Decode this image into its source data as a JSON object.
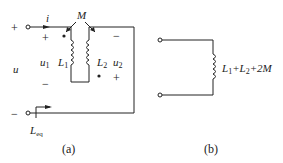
{
  "figure_a": {
    "caption": "(a)",
    "plus_terminal": "+",
    "minus_terminal": "−",
    "current_label": "i",
    "mutual_label": "M",
    "voltage_label": "u",
    "u1_label": "u",
    "u1_sub": "1",
    "u2_label": "u",
    "u2_sub": "2",
    "L1_label": "L",
    "L1_sub": "1",
    "L2_label": "L",
    "L2_sub": "2",
    "u1_plus": "+",
    "u1_minus": "−",
    "u2_plus": "+",
    "u2_minus": "−",
    "Leq_label": "L",
    "Leq_sub": "eq"
  },
  "figure_b": {
    "caption": "(b)",
    "inductance_label": "L",
    "inductance_sub1": "1",
    "plus1": "+L",
    "inductance_sub2": "2",
    "tail": "+2M"
  }
}
